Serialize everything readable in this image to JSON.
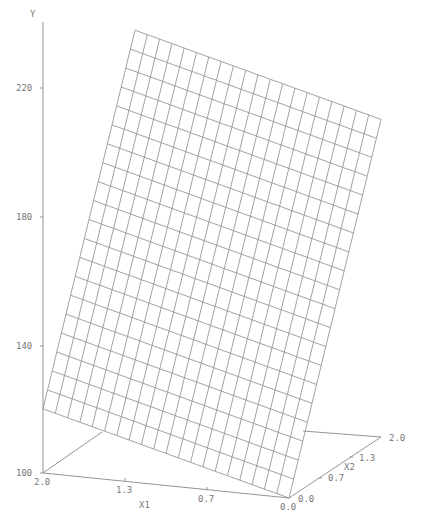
{
  "chart_data": {
    "type": "surface3d",
    "title": "",
    "xlabel": "X1",
    "x2label": "X2",
    "ylabel": "Y",
    "x1_ticks": [
      "2.0",
      "1.3",
      "0.7",
      "0.0"
    ],
    "x2_ticks": [
      "0.0",
      "0.7",
      "1.3",
      "2.0"
    ],
    "y_ticks": [
      "100",
      "140",
      "180",
      "220"
    ],
    "ylim": [
      100,
      240
    ],
    "x1_range": [
      0.0,
      2.0
    ],
    "x2_range": [
      0.0,
      2.0
    ],
    "grid_resolution": [
      20,
      20
    ],
    "surface_model": "plane",
    "corner_values": [
      {
        "x1": 0.0,
        "x2": 0.0,
        "y": 100
      },
      {
        "x1": 2.0,
        "x2": 0.0,
        "y": 120
      },
      {
        "x1": 0.0,
        "x2": 2.0,
        "y": 199
      },
      {
        "x1": 2.0,
        "x2": 2.0,
        "y": 219
      }
    ],
    "approx_equation": "Y = 100 + 10*X1 + 50*X2"
  },
  "colors": {
    "line": "#8a8a8a",
    "text": "#777777",
    "background": "#ffffff"
  }
}
